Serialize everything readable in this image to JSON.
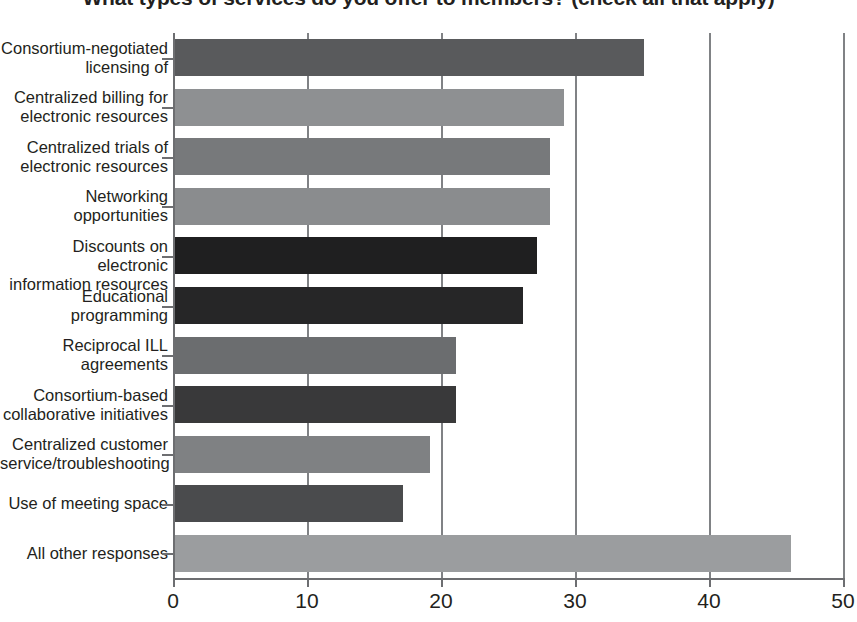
{
  "chart_data": {
    "type": "bar",
    "orientation": "horizontal",
    "title": "What types of services do you offer to members? (check all that apply)",
    "xlabel": "",
    "ylabel": "",
    "xlim": [
      0,
      50
    ],
    "xticks": [
      0,
      10,
      20,
      30,
      40,
      50
    ],
    "xtick_labels": [
      "0",
      "10",
      "20",
      "30",
      "40",
      "50"
    ],
    "grid": "vertical",
    "legend": "none",
    "categories": [
      "Consortium-negotiated licensing of",
      "Centralized billing for electronic resources",
      "Centralized trials of electronic resources",
      "Networking opportunities",
      "Discounts on electronic information resources",
      "Educational programming",
      "Reciprocal ILL agreements",
      "Consortium-based collaborative initiatives",
      "Centralized customer service/troubleshooting",
      "Use of meeting space",
      "All other responses"
    ],
    "category_lines": [
      [
        "Consortium-negotiated",
        "licensing of"
      ],
      [
        "Centralized billing for",
        "electronic resources"
      ],
      [
        "Centralized trials of",
        "electronic resources"
      ],
      [
        "Networking",
        "opportunities"
      ],
      [
        "Discounts on electronic",
        "information resources"
      ],
      [
        "Educational",
        "programming"
      ],
      [
        "Reciprocal ILL",
        "agreements"
      ],
      [
        "Consortium-based",
        "collaborative initiatives"
      ],
      [
        "Centralized customer",
        "service/troubleshooting"
      ],
      [
        "Use of meeting space"
      ],
      [
        "All other responses"
      ]
    ],
    "values": [
      35,
      29,
      28,
      28,
      27,
      26,
      21,
      21,
      19,
      17,
      46
    ],
    "bar_colors": [
      "#595a5c",
      "#8e9092",
      "#77797b",
      "#8a8c8e",
      "#1f1f20",
      "#262627",
      "#6b6d6f",
      "#39393a",
      "#7f8183",
      "#4a4b4d",
      "#9b9d9f"
    ]
  },
  "axis": {
    "axis_color": "#6d6e71",
    "grid_color": "#808285",
    "text_color": "#231f20"
  }
}
